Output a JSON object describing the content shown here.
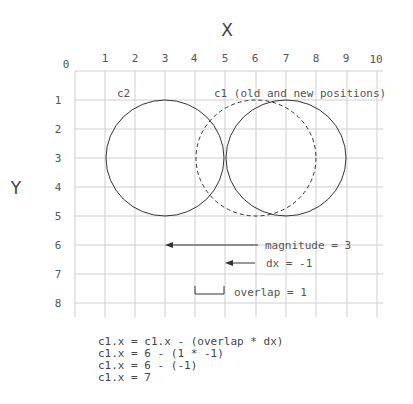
{
  "axes": {
    "x_title": "X",
    "y_title": "Y",
    "x_ticks": [
      "0",
      "1",
      "2",
      "3",
      "4",
      "5",
      "6",
      "7",
      "8",
      "9",
      "10"
    ],
    "y_ticks": [
      "1",
      "2",
      "3",
      "4",
      "5",
      "6",
      "7",
      "8"
    ]
  },
  "circles": {
    "c2_label": "c2",
    "c1_label": "c1 (old and new positions)",
    "c2": {
      "cx": 3,
      "cy": 3,
      "r": 2,
      "style": "solid"
    },
    "c1_old": {
      "cx": 6,
      "cy": 3,
      "r": 2,
      "style": "dashed"
    },
    "c1_new": {
      "cx": 7,
      "cy": 3,
      "r": 2,
      "style": "solid"
    }
  },
  "annotations": {
    "magnitude": "magnitude = 3",
    "dx": "dx = -1",
    "overlap": "overlap = 1"
  },
  "code_lines": [
    "c1.x = c1.x - (overlap * dx)",
    "c1.x = 6 - (1 * -1)",
    "c1.x = 6 - (-1)",
    "c1.x = 7"
  ],
  "colors": {
    "grid": "#cfcfcf",
    "stroke": "#333333",
    "text": "#555555"
  }
}
